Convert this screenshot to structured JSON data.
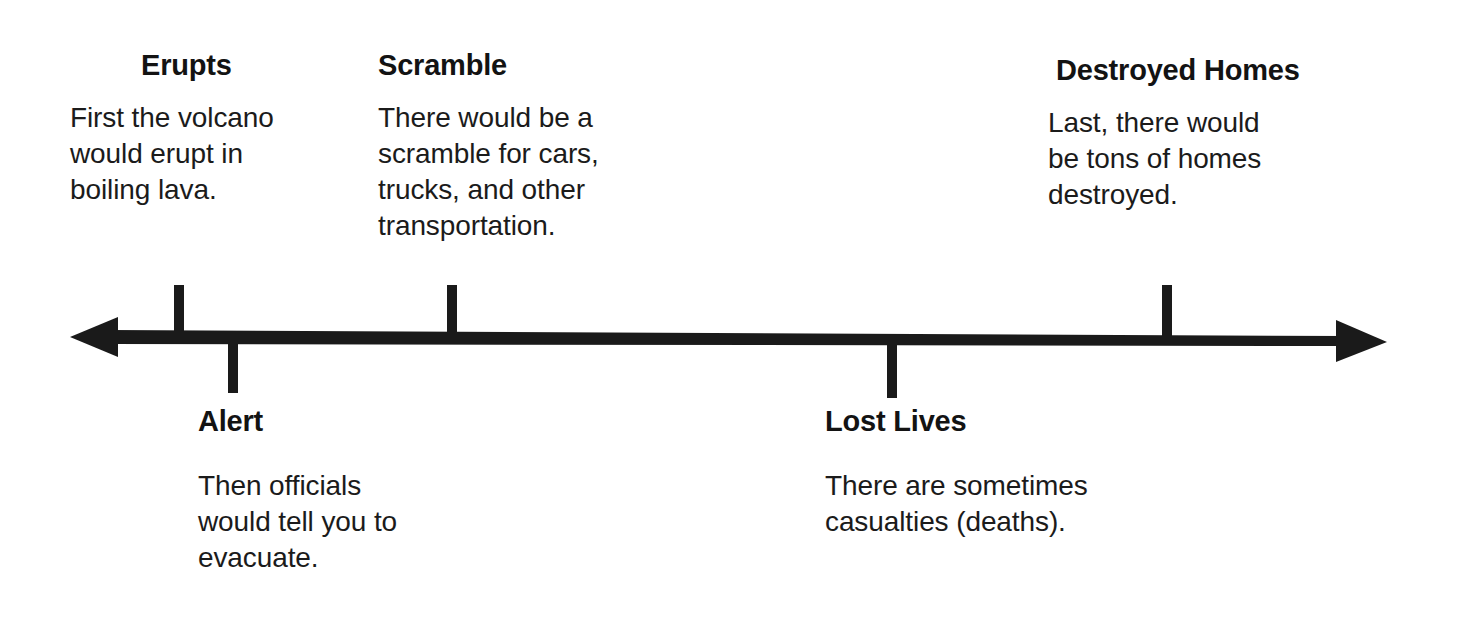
{
  "diagram": {
    "type": "timeline",
    "orientation": "horizontal",
    "arrow": {
      "style": "double-headed",
      "color": "#1a1a1a",
      "left_arrowhead": true,
      "right_arrowhead": true
    },
    "colors": {
      "background": "#ffffff",
      "line": "#1a1a1a",
      "heading_text": "#131313",
      "body_text": "#1b1b1b"
    },
    "events": [
      {
        "id": "erupts",
        "order": 1,
        "position": "above",
        "heading": "Erupts",
        "body_lines": [
          "First the volcano",
          "would erupt in",
          "boiling lava."
        ],
        "body_text": "First the volcano would erupt in boiling lava.",
        "tick_x": 179
      },
      {
        "id": "alert",
        "order": 2,
        "position": "below",
        "heading": "Alert",
        "body_lines": [
          "Then officials",
          "would tell you to",
          "evacuate."
        ],
        "body_text": "Then officials would tell you to evacuate.",
        "tick_x": 233
      },
      {
        "id": "scramble",
        "order": 3,
        "position": "above",
        "heading": "Scramble",
        "body_lines": [
          "There would be a",
          "scramble for cars,",
          "trucks, and other",
          "transportation."
        ],
        "body_text": "There would be a scramble for cars, trucks, and other transportation.",
        "tick_x": 452
      },
      {
        "id": "lost-lives",
        "order": 4,
        "position": "below",
        "heading": "Lost Lives",
        "body_lines": [
          "There are sometimes",
          "casualties (deaths)."
        ],
        "body_text": "There are sometimes casualties (deaths).",
        "tick_x": 892
      },
      {
        "id": "destroyed-homes",
        "order": 5,
        "position": "above",
        "heading": "Destroyed Homes",
        "body_lines": [
          "Last, there would",
          "be tons of homes",
          "destroyed."
        ],
        "body_text": "Last, there would be tons of homes destroyed.",
        "tick_x": 1167
      }
    ]
  }
}
